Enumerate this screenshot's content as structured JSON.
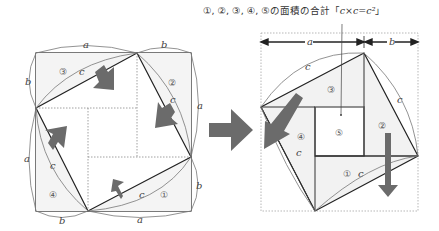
{
  "caption": {
    "prefix": "①, ②, ③, ④, ⑤の面積の合計「",
    "formula": "c×c=c²",
    "suffix": "」"
  },
  "labels": {
    "a": "a",
    "b": "b",
    "c": "c",
    "piece1": "①",
    "piece2": "②",
    "piece3": "③",
    "piece4": "④",
    "piece5": "⑤"
  },
  "colors": {
    "line": "#222222",
    "arc": "#666666",
    "arrow": "#6b6b6b",
    "fill": "#f2f2f2",
    "dotted": "#888888"
  }
}
